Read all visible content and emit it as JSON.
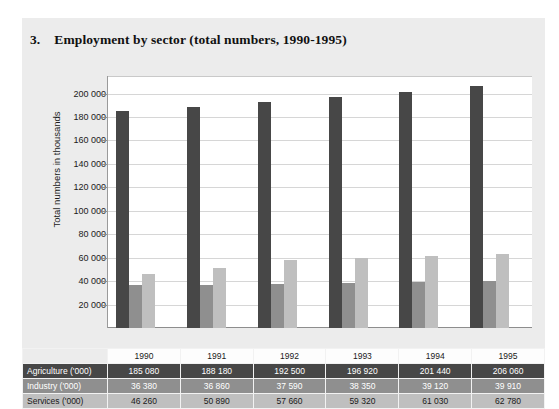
{
  "figure": {
    "number": "3.",
    "title": "Employment by sector (total numbers, 1990-1995)"
  },
  "chart_data": {
    "type": "bar",
    "title": "Employment by sector (total numbers, 1990-1995)",
    "xlabel": "",
    "ylabel": "Total numbers in thousands",
    "categories": [
      "1990",
      "1991",
      "1992",
      "1993",
      "1994",
      "1995"
    ],
    "series": [
      {
        "name": "Agriculture ('000)",
        "color": "#474747",
        "values": [
          185080,
          188180,
          192500,
          196920,
          201440,
          206060
        ]
      },
      {
        "name": "Industry ('000)",
        "color": "#8f8f8f",
        "values": [
          36380,
          36860,
          37590,
          38350,
          39120,
          39910
        ]
      },
      {
        "name": "Services ('000)",
        "color": "#bfbfbf",
        "values": [
          46260,
          50890,
          57660,
          59320,
          61030,
          62780
        ]
      }
    ],
    "ylim": [
      0,
      215000
    ],
    "yticks": [
      20000,
      40000,
      60000,
      80000,
      100000,
      120000,
      140000,
      160000,
      180000,
      200000
    ],
    "ytick_labels": [
      "20 000",
      "40 000",
      "60 000",
      "80 000",
      "100 000",
      "120 000",
      "140 000",
      "160 000",
      "180 000",
      "200 000"
    ],
    "grid": true,
    "legend": "none"
  },
  "table": {
    "year_header": [
      "1990",
      "1991",
      "1992",
      "1993",
      "1994",
      "1995"
    ],
    "rows": [
      {
        "label": "Agriculture ('000)",
        "values": [
          "185 080",
          "188 180",
          "192 500",
          "196 920",
          "201 440",
          "206 060"
        ]
      },
      {
        "label": "Industry ('000)",
        "values": [
          "36 380",
          "36 860",
          "37 590",
          "38 350",
          "39 120",
          "39 910"
        ]
      },
      {
        "label": "Services ('000)",
        "values": [
          "46 260",
          "50 890",
          "57 660",
          "59 320",
          "61 030",
          "62 780"
        ]
      }
    ]
  }
}
